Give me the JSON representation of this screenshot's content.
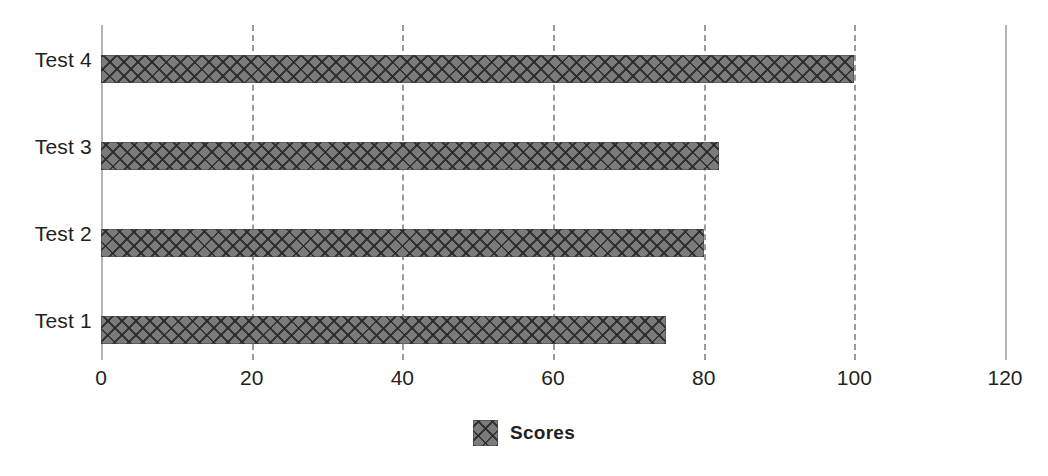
{
  "chart_data": {
    "type": "bar",
    "orientation": "horizontal",
    "title": "",
    "xlabel": "",
    "ylabel": "",
    "categories": [
      "Test 1",
      "Test 2",
      "Test 3",
      "Test 4"
    ],
    "series": [
      {
        "name": "Scores",
        "values": [
          75,
          80,
          82,
          100
        ]
      }
    ],
    "xlim": [
      0,
      120
    ],
    "xticks": [
      0,
      20,
      40,
      60,
      80,
      100,
      120
    ],
    "xtick_labels": [
      "0",
      "20",
      "40",
      "60",
      "80",
      "100",
      "120"
    ],
    "grid": "vertical-dashed",
    "legend": {
      "position": "bottom-center",
      "entries": [
        {
          "label": "Scores",
          "swatch": "crosshatch-gray"
        }
      ]
    },
    "colors": {
      "bar_fill": "#7b7b7b",
      "bar_hatch": "#282828",
      "gridline": "#9a9a9a",
      "axis_line": "#b5b5b5",
      "text": "#231f20",
      "background": "#ffffff"
    }
  }
}
